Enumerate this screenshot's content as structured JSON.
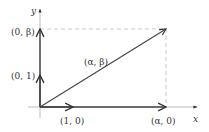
{
  "diagram": {
    "axes": {
      "x_label": "x",
      "y_label": "y"
    },
    "vectors": [
      {
        "name": "e1",
        "label": "(1, 0)"
      },
      {
        "name": "e2",
        "label": "(0, 1)"
      },
      {
        "name": "alpha-x",
        "label": "(α, 0)"
      },
      {
        "name": "beta-y",
        "label": "(0, β)"
      },
      {
        "name": "alpha-beta",
        "label": "(α, β)"
      }
    ],
    "colors": {
      "axis": "#999999",
      "vector": "#444444",
      "dashed": "#bbbbbb"
    }
  }
}
